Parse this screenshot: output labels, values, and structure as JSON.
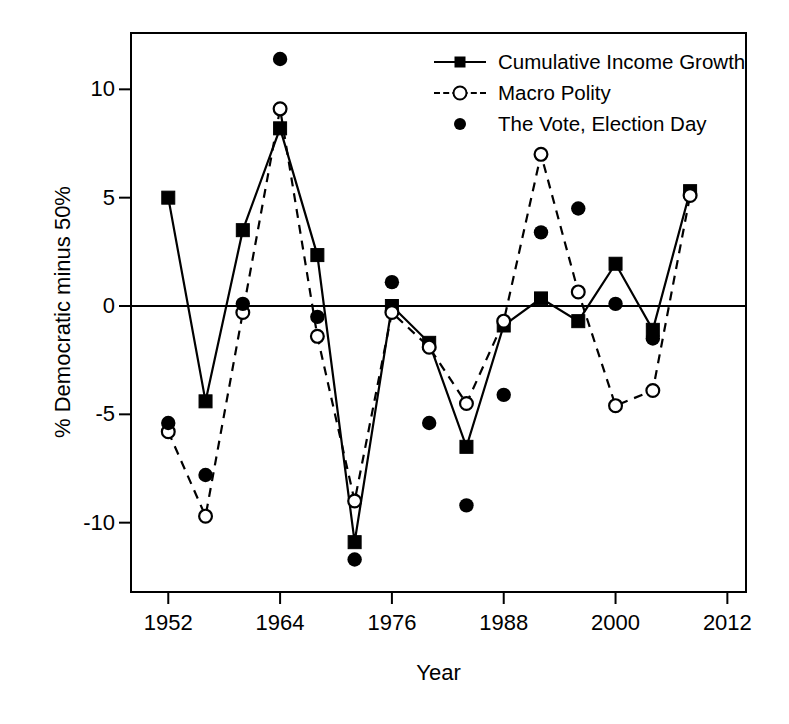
{
  "chart_data": {
    "type": "line",
    "title": "",
    "xlabel": "Year",
    "ylabel": "% Democratic minus 50%",
    "xlim": [
      1948,
      2014
    ],
    "ylim": [
      -13.2,
      12.6
    ],
    "xticks": [
      1952,
      1964,
      1976,
      1988,
      2000,
      2012
    ],
    "xtick_labels": [
      "1952",
      "1964",
      "1976",
      "1988",
      "2000",
      "2012"
    ],
    "yticks": [
      -10,
      -5,
      0,
      5,
      10
    ],
    "ytick_labels": [
      "-10",
      "-5",
      "0",
      "5",
      "10"
    ],
    "grid": false,
    "zero_line": true,
    "legend_position": "top-right",
    "x": [
      1952,
      1956,
      1960,
      1964,
      1968,
      1972,
      1976,
      1980,
      1984,
      1988,
      1992,
      1996,
      2000,
      2004,
      2008
    ],
    "series": [
      {
        "name": "Cumulative Income Growth",
        "marker": "filled-square",
        "line": "solid",
        "values": [
          5.0,
          -4.4,
          3.5,
          8.2,
          2.35,
          -10.9,
          0.0,
          -1.7,
          -6.5,
          -0.9,
          0.35,
          -0.7,
          1.95,
          -1.1,
          5.3
        ]
      },
      {
        "name": "Macro Polity",
        "marker": "open-circle",
        "line": "dashed",
        "values": [
          -5.8,
          -9.7,
          -0.3,
          9.1,
          -1.4,
          -9.0,
          -0.3,
          -1.9,
          -4.5,
          -0.7,
          7.0,
          0.65,
          -4.6,
          -3.9,
          5.1
        ]
      },
      {
        "name": "The Vote, Election Day",
        "marker": "filled-circle",
        "line": "none",
        "values": [
          -5.4,
          -7.8,
          0.1,
          11.4,
          -0.5,
          -11.7,
          1.1,
          -5.4,
          -9.2,
          -4.1,
          3.4,
          4.5,
          0.1,
          -1.5,
          null
        ]
      }
    ]
  },
  "legend": {
    "items": [
      {
        "label": "Cumulative Income Growth",
        "key": "line-square"
      },
      {
        "label": "Macro Polity",
        "key": "dashed-circle"
      },
      {
        "label": "The Vote, Election Day",
        "key": "dot"
      }
    ]
  },
  "colors": {
    "foreground": "#000000",
    "background": "#ffffff"
  }
}
